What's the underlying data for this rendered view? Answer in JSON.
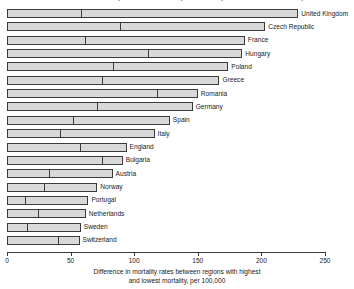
{
  "chart_data": {
    "type": "bar",
    "orientation": "horizontal",
    "title": "Difference in mortality rates between regions with highest and lowest mortality",
    "xlabel_line1": "Difference in mortality rates between regions with highest",
    "xlabel_line2": "and lowest mortality, per 100,000",
    "ylabel": "",
    "xlim": [
      0,
      250
    ],
    "xticks": [
      0,
      50,
      100,
      150,
      200,
      250
    ],
    "xtick_labels": [
      "0",
      "50",
      "100",
      "150",
      "200",
      "250"
    ],
    "grid": false,
    "legend": false,
    "categories": [
      "United Kingdom",
      "Czech Republic",
      "France",
      "Hungary",
      "Poland",
      "Greece",
      "Romania",
      "Germany",
      "Spain",
      "Italy",
      "England",
      "Bulgaria",
      "Austria",
      "Norway",
      "Portugal",
      "Netherlands",
      "Sweden",
      "Switzerland"
    ],
    "values": [
      229,
      203,
      187,
      185,
      174,
      167,
      150,
      146,
      128,
      116,
      94,
      91,
      83,
      71,
      64,
      62,
      58,
      57
    ],
    "marker_values": [
      58,
      89,
      61,
      111,
      83,
      75,
      118,
      71,
      52,
      42,
      57,
      75,
      33,
      29,
      14,
      24,
      16,
      40
    ],
    "series": [
      {
        "name": "Difference in mortality rates",
        "values": [
          229,
          203,
          187,
          185,
          174,
          167,
          150,
          146,
          128,
          116,
          94,
          91,
          83,
          71,
          64,
          62,
          58,
          57
        ]
      },
      {
        "name": "Internal divider position",
        "values": [
          58,
          89,
          61,
          111,
          83,
          75,
          118,
          71,
          52,
          42,
          57,
          75,
          33,
          29,
          14,
          24,
          16,
          40
        ]
      }
    ],
    "bar_fill_color": "#d9d9d9",
    "bar_edge_color": "#3a3a3a"
  }
}
